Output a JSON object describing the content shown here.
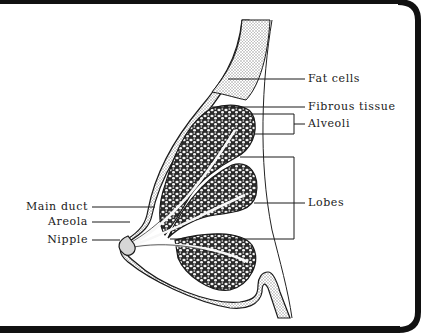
{
  "diagram": {
    "type": "anatomical-cross-section",
    "labels": {
      "fat_cells": "Fat cells",
      "fibrous_tissue": "Fibrous tissue",
      "alveoli": "Alveoli",
      "lobes": "Lobes",
      "main_duct": "Main duct",
      "areola": "Areola",
      "nipple": "Nipple"
    },
    "colors": {
      "ink": "#1a1a1a",
      "border": "#111111",
      "fat_stipple": "#bdbdbd",
      "background": "#ffffff"
    }
  }
}
